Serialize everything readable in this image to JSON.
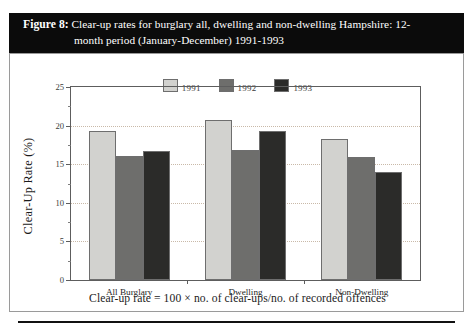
{
  "figure": {
    "label": "Figure 8:",
    "title_line1": "Clear-up rates for burglary all, dwelling and non-dwelling Hampshire: 12-",
    "title_line2": "month period (January-December) 1991-1993",
    "footnote": "Clear-up rate = 100 × no. of clear-ups/no. of recorded offences"
  },
  "chart_data": {
    "type": "bar",
    "xlabel": "",
    "ylabel": "Clear-Up Rate (%)",
    "categories": [
      "All Burglary",
      "Dwelling",
      "Non-Dwelling"
    ],
    "series": [
      {
        "name": "1991",
        "color": "#d2d2cf",
        "values": [
          19.3,
          20.7,
          18.3
        ]
      },
      {
        "name": "1992",
        "color": "#6e6e6c",
        "values": [
          16.1,
          16.8,
          15.9
        ]
      },
      {
        "name": "1993",
        "color": "#2b2b29",
        "values": [
          16.7,
          19.3,
          14.0
        ]
      }
    ],
    "ylim": [
      0,
      25
    ],
    "yticks": [
      0,
      5,
      10,
      15,
      20,
      25
    ],
    "ytick_labels": [
      "0",
      "5",
      "10",
      "15",
      "20",
      "25"
    ],
    "yminor_ticks": [
      2.5,
      7.5,
      12.5,
      17.5,
      22.5
    ],
    "grid": true,
    "gridlines": [
      5,
      10,
      15,
      20
    ],
    "legend_position": "top-center",
    "bar_edge_color": "#6e6e6e",
    "axis_color": "#5d5d5d",
    "grid_color": "#c9b9a8"
  }
}
